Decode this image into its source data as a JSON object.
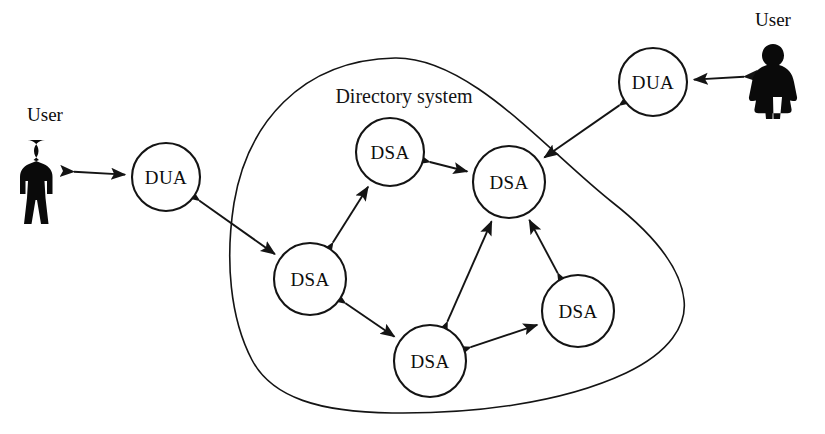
{
  "diagram": {
    "boundary": {
      "label": "Directory system",
      "name": "directory-system-boundary"
    },
    "colors": {
      "ink": "#141414",
      "fill": "#ffffff",
      "silhouette": "#0a0a0a"
    },
    "nodes": [
      {
        "id": "dua-left",
        "label": "DUA",
        "type": "dua",
        "cx": 166,
        "cy": 177,
        "r": 34
      },
      {
        "id": "dua-right",
        "label": "DUA",
        "type": "dua",
        "cx": 653,
        "cy": 82,
        "r": 34
      },
      {
        "id": "dsa-top",
        "label": "DSA",
        "type": "dsa",
        "cx": 390,
        "cy": 152,
        "r": 34
      },
      {
        "id": "dsa-upper-right",
        "label": "DSA",
        "type": "dsa",
        "cx": 509,
        "cy": 182,
        "r": 36
      },
      {
        "id": "dsa-left",
        "label": "DSA",
        "type": "dsa",
        "cx": 310,
        "cy": 279,
        "r": 36
      },
      {
        "id": "dsa-right",
        "label": "DSA",
        "type": "dsa",
        "cx": 578,
        "cy": 311,
        "r": 36
      },
      {
        "id": "dsa-bottom",
        "label": "DSA",
        "type": "dsa",
        "cx": 430,
        "cy": 361,
        "r": 36
      }
    ],
    "users": [
      {
        "id": "user-left",
        "label": "User",
        "gender": "male",
        "x": 45,
        "y": 170,
        "label_x": 45,
        "label_y": 121
      },
      {
        "id": "user-right",
        "label": "User",
        "gender": "female",
        "x": 773,
        "y": 75,
        "label_x": 773,
        "label_y": 26
      }
    ],
    "links": [
      {
        "from": "user-left",
        "to": "dua-left",
        "arrows": "both",
        "name": "link-user-left-dua-left"
      },
      {
        "from": "user-right",
        "to": "dua-right",
        "arrows": "both",
        "name": "link-user-right-dua-right"
      },
      {
        "from": "dua-left",
        "to": "dsa-left",
        "arrows": "both",
        "name": "link-dua-left-dsa-left"
      },
      {
        "from": "dua-right",
        "to": "dsa-upper-right",
        "arrows": "both",
        "name": "link-dua-right-dsa-upper-right"
      },
      {
        "from": "dsa-left",
        "to": "dsa-top",
        "arrows": "both",
        "name": "link-dsa-left-dsa-top"
      },
      {
        "from": "dsa-top",
        "to": "dsa-upper-right",
        "arrows": "both",
        "name": "link-dsa-top-dsa-upper-right"
      },
      {
        "from": "dsa-left",
        "to": "dsa-bottom",
        "arrows": "both",
        "name": "link-dsa-left-dsa-bottom"
      },
      {
        "from": "dsa-bottom",
        "to": "dsa-upper-right",
        "arrows": "both",
        "name": "link-dsa-bottom-dsa-upper-right"
      },
      {
        "from": "dsa-bottom",
        "to": "dsa-right",
        "arrows": "both",
        "name": "link-dsa-bottom-dsa-right"
      },
      {
        "from": "dsa-right",
        "to": "dsa-upper-right",
        "arrows": "both",
        "name": "link-dsa-right-dsa-upper-right"
      }
    ],
    "boundary_path": "M 395 58 C 300 60 247 125 234 203 C 225 260 230 318 252 360 C 272 398 320 412 392 413 C 470 414 560 404 626 373 C 670 352 687 325 684 300 C 681 270 658 238 612 202 C 546 150 470 57 395 58 Z",
    "boundary_label_pos": {
      "x": 404,
      "y": 103
    }
  }
}
